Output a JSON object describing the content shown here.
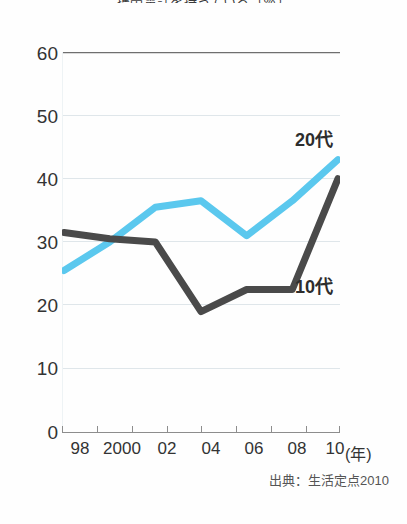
{
  "chart_data": {
    "type": "line",
    "title": "携帯電話を持っている（％）",
    "xlabel": "(年)",
    "ylabel": "",
    "categories": [
      "98",
      "2000",
      "02",
      "04",
      "06",
      "08",
      "10"
    ],
    "x": [
      1998,
      2000,
      2002,
      2004,
      2006,
      2008,
      2010
    ],
    "ylim": [
      0,
      60
    ],
    "yticks": [
      0,
      10,
      20,
      30,
      40,
      50,
      60
    ],
    "grid": true,
    "legend_position": "inline-right",
    "series": [
      {
        "name": "20代",
        "color": "#5BC8EE",
        "values": [
          25.5,
          30.0,
          35.5,
          36.5,
          31.0,
          36.5,
          43.0
        ]
      },
      {
        "name": "10代",
        "color": "#4A4A4A",
        "values": [
          31.5,
          30.5,
          30.0,
          19.0,
          22.5,
          22.5,
          40.0
        ]
      }
    ],
    "annotations": [
      {
        "text": "20代",
        "series": "20代"
      },
      {
        "text": "10代",
        "series": "10代"
      }
    ],
    "source": "出典：生活定点2010"
  },
  "axes": {
    "x_unit_label": "(年)",
    "y_tick_labels": [
      "60",
      "50",
      "40",
      "30",
      "20",
      "10",
      "0"
    ],
    "x_tick_labels": [
      "98",
      "2000",
      "02",
      "04",
      "06",
      "08",
      "10"
    ]
  },
  "colors": {
    "series_20dai": "#5BC8EE",
    "series_10dai": "#4A4A4A",
    "gridline": "#dfe6ea",
    "axis": "#8d8d8d",
    "text": "#333333",
    "background": "#fefefe"
  },
  "footer": {
    "source_text": "出典：生活定点2010"
  }
}
